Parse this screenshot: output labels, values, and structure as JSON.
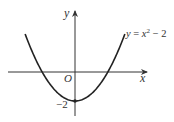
{
  "chart_data": {
    "type": "line",
    "title": "",
    "function": "y = x^2 - 2",
    "curve_label": "y = x",
    "curve_label_exp": "2",
    "curve_label_tail": " − 2",
    "xlabel": "x",
    "ylabel": "y",
    "origin_label": "O",
    "y_intercept_label": "−2",
    "x": [
      -2.5,
      -2,
      -1.5,
      -1.414,
      -1,
      -0.5,
      0,
      0.5,
      1,
      1.414,
      1.5,
      2,
      2.5
    ],
    "y": [
      4.25,
      2,
      0.25,
      0,
      -1,
      -1.75,
      -2,
      -1.75,
      -1,
      0,
      0.25,
      2,
      4.25
    ],
    "vertex": [
      0,
      -2
    ],
    "x_intercepts": [
      -1.414,
      1.414
    ],
    "grid": false,
    "legend": "none"
  },
  "colors": {
    "curve": "#222222",
    "axis": "#333333",
    "text": "#333333"
  }
}
